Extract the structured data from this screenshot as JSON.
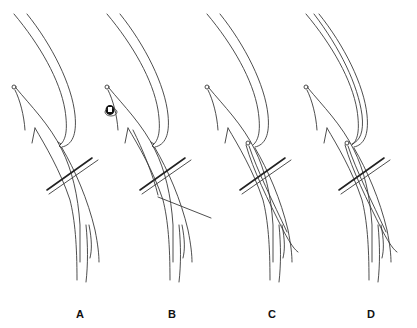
{
  "figure": {
    "panels": [
      {
        "label": "A",
        "offset_x": 0,
        "label_x": 80,
        "variant": "tied"
      },
      {
        "label": "B",
        "offset_x": 93,
        "label_x": 172,
        "variant": "clip"
      },
      {
        "label": "C",
        "offset_x": 193,
        "label_x": 272,
        "variant": "inserted"
      },
      {
        "label": "D",
        "offset_x": 292,
        "label_x": 371,
        "variant": "double-inserted"
      }
    ],
    "colors": {
      "line": "#3a3a3a",
      "background": "#ffffff",
      "label": "#111111"
    }
  }
}
